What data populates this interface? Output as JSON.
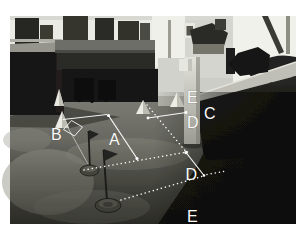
{
  "figure": {
    "labels": {
      "a": "A",
      "b": "B",
      "c": "C",
      "d_upper": "D",
      "d_lower": "D",
      "e_upper": "E",
      "e_lower": "E"
    },
    "colors": {
      "annotation": "#ffffff",
      "window_light": "#efefeb",
      "floor_mid": "#7e7e77",
      "shadow_dark": "#0d0d0b"
    }
  }
}
